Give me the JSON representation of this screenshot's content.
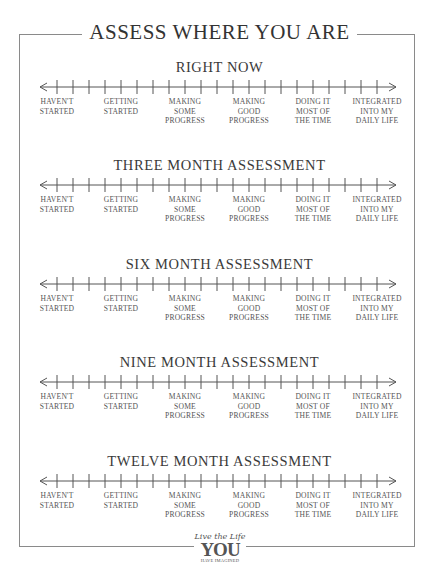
{
  "page_title": "ASSESS WHERE YOU ARE",
  "scale": {
    "tick_count": 21,
    "labels": [
      [
        "HAVEN'T",
        "STARTED"
      ],
      [
        "GETTING",
        "STARTED"
      ],
      [
        "MAKING",
        "SOME",
        "PROGRESS"
      ],
      [
        "MAKING",
        "GOOD",
        "PROGRESS"
      ],
      [
        "DOING IT",
        "MOST OF",
        "THE TIME"
      ],
      [
        "INTEGRATED",
        "INTO MY",
        "DAILY LIFE"
      ]
    ]
  },
  "sections": [
    {
      "heading": "RIGHT NOW"
    },
    {
      "heading": "THREE MONTH ASSESSMENT"
    },
    {
      "heading": "SIX MONTH ASSESSMENT"
    },
    {
      "heading": "NINE MONTH ASSESSMENT"
    },
    {
      "heading": "TWELVE MONTH ASSESSMENT"
    }
  ],
  "logo": {
    "line1": "Live the Life",
    "line2": "YOU",
    "line3": "HAVE IMAGINED"
  },
  "colors": {
    "border": "#8a8a8a",
    "text": "#3a3a3a",
    "line": "#555555"
  }
}
